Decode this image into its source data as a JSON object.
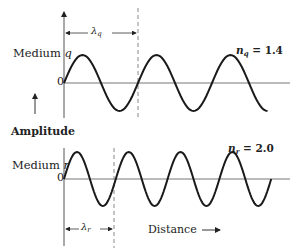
{
  "figure": {
    "type": "wave-diagram",
    "top_panel": {
      "medium_label": "Medium",
      "medium_symbol": "q",
      "zero_label": "0",
      "wavelength_symbol": "λ",
      "wavelength_subscript": "q",
      "index_symbol": "n",
      "index_subscript": "q",
      "index_value": "= 1.4",
      "wavelength_px": 74,
      "cycles_shown": 2.75
    },
    "bottom_panel": {
      "medium_label": "Medium",
      "medium_symbol": "r",
      "zero_label": "0",
      "wavelength_symbol": "λ",
      "wavelength_subscript": "r",
      "index_symbol": "n",
      "index_subscript": "r",
      "index_value": "= 2.0",
      "wavelength_px": 51.8,
      "cycles_shown": 4
    },
    "y_axis_label": "Amplitude",
    "x_axis_label": "Distance",
    "colors": {
      "curve": "#1a1a1a",
      "axis": "#555555",
      "dashed": "#777777",
      "text": "#222222"
    }
  }
}
